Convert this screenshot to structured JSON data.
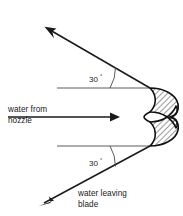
{
  "figure": {
    "type": "engineering-diagram",
    "background_color": "#ffffff",
    "ink_color": "#1a1a1a",
    "width": 183,
    "height": 216
  },
  "labels": {
    "inlet_line1": "water from",
    "inlet_line2": "nozzle",
    "outlet_line1": "water leaving",
    "outlet_line2": "blade",
    "angle_upper": "30",
    "angle_lower": "30",
    "degree_symbol": "°"
  },
  "annotations": [
    {
      "name": "water-from-nozzle",
      "text": "water from nozzle",
      "role": "incoming jet label",
      "position": "left-middle"
    },
    {
      "name": "water-leaving-blade",
      "text": "water leaving blade",
      "role": "outgoing jet label",
      "position": "bottom-center"
    },
    {
      "name": "upper-deflection-angle",
      "text": "30°",
      "role": "angle between upper reference line and upper exit jet",
      "position": "upper-middle"
    },
    {
      "name": "lower-deflection-angle",
      "text": "30°",
      "role": "angle between lower reference line and lower exit jet",
      "position": "lower-middle"
    }
  ],
  "geometry": {
    "inlet_arrow": {
      "name": "inlet-jet-arrow",
      "from_x": 8,
      "from_y": 117,
      "to_x": 120,
      "to_y": 117,
      "direction": "right"
    },
    "upper_exit_arrow": {
      "name": "upper-exit-jet-arrow",
      "from_x": 150,
      "from_y": 88,
      "to_x": 46,
      "to_y": 28,
      "direction": "up-left",
      "angle_deg": 30
    },
    "lower_exit_arrow": {
      "name": "lower-exit-jet-arrow",
      "from_x": 150,
      "from_y": 146,
      "to_x": 40,
      "to_y": 205,
      "direction": "down-left",
      "angle_deg": 30
    },
    "upper_reference_line": {
      "name": "upper-reference-line",
      "from_x": 57,
      "from_y": 88,
      "to_x": 150,
      "to_y": 88
    },
    "lower_reference_line": {
      "name": "lower-reference-line",
      "from_x": 57,
      "from_y": 146,
      "to_x": 150,
      "to_y": 146
    },
    "blade": {
      "name": "split-bucket-blade",
      "hatched": true,
      "upper_tip_x": 150,
      "upper_tip_y": 88,
      "center_cusp_x": 145,
      "center_cusp_y": 117,
      "lower_tip_x": 150,
      "lower_tip_y": 146,
      "right_extent_x": 179
    }
  }
}
